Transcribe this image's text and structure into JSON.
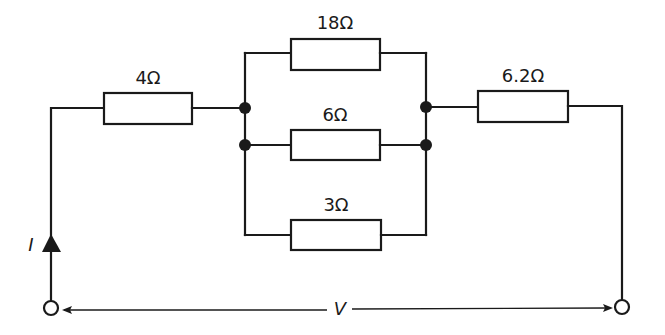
{
  "diagram": {
    "type": "circuit",
    "colors": {
      "wire": "#1a1a1a",
      "background": "#ffffff"
    },
    "resistors": [
      {
        "id": "r1",
        "label": "4Ω",
        "value_ohms": 4,
        "position": "series-left"
      },
      {
        "id": "r2",
        "label": "18Ω",
        "value_ohms": 18,
        "position": "parallel-top"
      },
      {
        "id": "r3",
        "label": "6Ω",
        "value_ohms": 6,
        "position": "parallel-middle"
      },
      {
        "id": "r4",
        "label": "3Ω",
        "value_ohms": 3,
        "position": "parallel-bottom"
      },
      {
        "id": "r5",
        "label": "6.2Ω",
        "value_ohms": 6.2,
        "position": "series-right"
      }
    ],
    "current_label": "I",
    "voltage_label": "V",
    "junction_count": 4,
    "terminal_count": 2
  }
}
